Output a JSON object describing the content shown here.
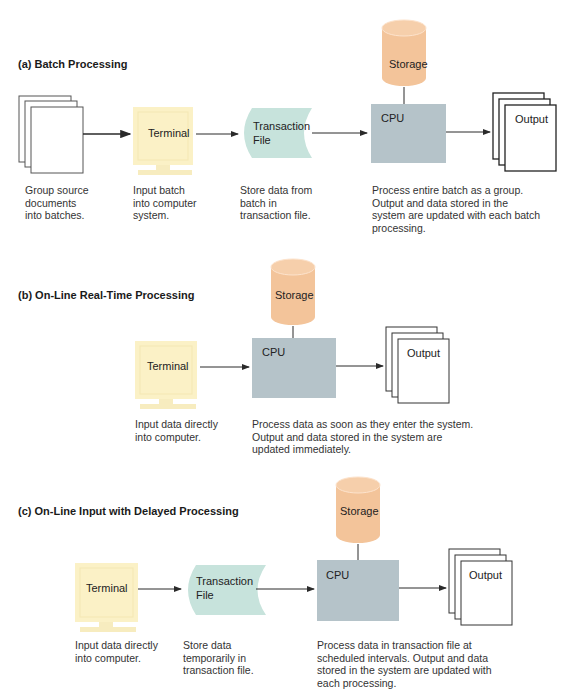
{
  "colors": {
    "storage": "#f3c49a",
    "cpu": "#b5c3c9",
    "terminal": "#fbf1c6",
    "transaction_file": "#c7e3dc",
    "paper": "#ffffff",
    "line": "#2a2a2a"
  },
  "sections": [
    {
      "title": "(a) Batch Processing",
      "nodes": {
        "documents": "",
        "terminal": "Terminal",
        "transaction_file_line1": "Transaction",
        "transaction_file_line2": "File",
        "storage": "Storage",
        "cpu": "CPU",
        "output": "Output"
      },
      "captions": {
        "documents": "Group source\ndocuments\ninto batches.",
        "terminal": "Input batch\ninto computer\nsystem.",
        "transaction_file": "Store data from\nbatch in\ntransaction file.",
        "cpu": "Process entire batch as a group.\nOutput and data stored in the\nsystem are updated with each batch\nprocessing."
      }
    },
    {
      "title": "(b) On-Line Real-Time Processing",
      "nodes": {
        "terminal": "Terminal",
        "storage": "Storage",
        "cpu": "CPU",
        "output": "Output"
      },
      "captions": {
        "terminal": "Input data directly\ninto computer.",
        "cpu": "Process data as soon as they enter the system.\nOutput and data stored in the system are\nupdated immediately."
      }
    },
    {
      "title": "(c) On-Line Input with Delayed Processing",
      "nodes": {
        "terminal": "Terminal",
        "transaction_file_line1": "Transaction",
        "transaction_file_line2": "File",
        "storage": "Storage",
        "cpu": "CPU",
        "output": "Output"
      },
      "captions": {
        "terminal": "Input data directly\ninto computer.",
        "transaction_file": "Store data\ntemporarily in\ntransaction file.",
        "cpu": "Process data in transaction file at\nscheduled intervals. Output and data\nstored in the system are updated with\neach processing."
      }
    }
  ]
}
